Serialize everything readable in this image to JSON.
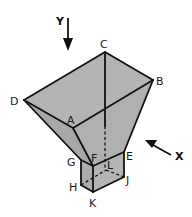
{
  "figure": {
    "type": "isometric-hopper-diagram",
    "colors": {
      "face_fill": "#b4b4b4",
      "face_fill_dark": "#a6a6a6",
      "edge": "#111111",
      "background": "#ffffff"
    },
    "axes": {
      "y": {
        "label": "Y",
        "direction": "down"
      },
      "x": {
        "label": "X",
        "direction": "up-left"
      }
    },
    "vertices": {
      "A": {
        "label": "A",
        "x": 73,
        "y": 128
      },
      "B": {
        "label": "B",
        "x": 153,
        "y": 80
      },
      "C": {
        "label": "C",
        "x": 105,
        "y": 52
      },
      "D": {
        "label": "D",
        "x": 24,
        "y": 100
      },
      "E": {
        "label": "E",
        "x": 124,
        "y": 152
      },
      "F": {
        "label": "F",
        "x": 93,
        "y": 166
      },
      "G": {
        "label": "G",
        "x": 81,
        "y": 160
      },
      "H": {
        "label": "H",
        "x": 81,
        "y": 185
      },
      "J": {
        "label": "J",
        "x": 124,
        "y": 177
      },
      "K": {
        "label": "K",
        "x": 93,
        "y": 192
      },
      "L": {
        "label": "L",
        "x": 106,
        "y": 170
      }
    }
  }
}
